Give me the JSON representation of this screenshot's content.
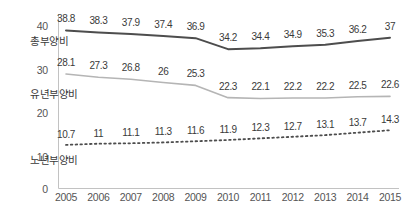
{
  "chart_data": {
    "type": "line",
    "title": "",
    "subtitle": "",
    "xlabel": "",
    "ylabel": "",
    "grid": false,
    "legend_position": "inline-left",
    "categories": [
      "2005",
      "2006",
      "2007",
      "2008",
      "2009",
      "2010",
      "2011",
      "2012",
      "2013",
      "2014",
      "2015"
    ],
    "x": [
      2005,
      2006,
      2007,
      2008,
      2009,
      2010,
      2011,
      2012,
      2013,
      2014,
      2015
    ],
    "ylim": [
      0,
      43
    ],
    "yticks": [
      0,
      10,
      20,
      30,
      40
    ],
    "ytick_labels": [
      "0",
      "10",
      "20",
      "30",
      "40"
    ],
    "series": [
      {
        "name": "총부양비",
        "style": "solid",
        "color": "#4d4d4d",
        "width": 2.0,
        "values": [
          38.8,
          38.3,
          37.9,
          37.4,
          36.9,
          34.2,
          34.4,
          34.9,
          35.3,
          36.2,
          37.0
        ],
        "labels": [
          "38.8",
          "38.3",
          "37.9",
          "37.4",
          "36.9",
          "34.2",
          "34.4",
          "34.9",
          "35.3",
          "36.2",
          "37"
        ]
      },
      {
        "name": "유년부양비",
        "style": "solid",
        "color": "#b5b5b5",
        "width": 1.6,
        "values": [
          28.1,
          27.3,
          26.8,
          26.0,
          25.3,
          22.3,
          22.1,
          22.2,
          22.2,
          22.5,
          22.6
        ],
        "labels": [
          "28.1",
          "27.3",
          "26.8",
          "26",
          "25.3",
          "22.3",
          "22.1",
          "22.2",
          "22.2",
          "22.5",
          "22.6"
        ]
      },
      {
        "name": "노년부양비",
        "style": "dotted",
        "color": "#4d4d4d",
        "width": 1.8,
        "values": [
          10.7,
          11.0,
          11.1,
          11.3,
          11.6,
          11.9,
          12.3,
          12.7,
          13.1,
          13.7,
          14.3
        ],
        "labels": [
          "10.7",
          "11",
          "11.1",
          "11.3",
          "11.6",
          "11.9",
          "12.3",
          "12.7",
          "13.1",
          "13.7",
          "14.3"
        ]
      }
    ],
    "axis_color": "#bdbdbd"
  },
  "axis": {
    "y_labels": [
      "40",
      "30",
      "20",
      "10",
      "0"
    ],
    "x_labels": [
      "2005",
      "2006",
      "2007",
      "2008",
      "2009",
      "2010",
      "2011",
      "2012",
      "2013",
      "2014",
      "2015"
    ]
  },
  "legend": {
    "total_label": "총부양비",
    "youth_label": "유년부양비",
    "elderly_label": "노년부양비"
  },
  "footnote": {
    "text": ""
  }
}
